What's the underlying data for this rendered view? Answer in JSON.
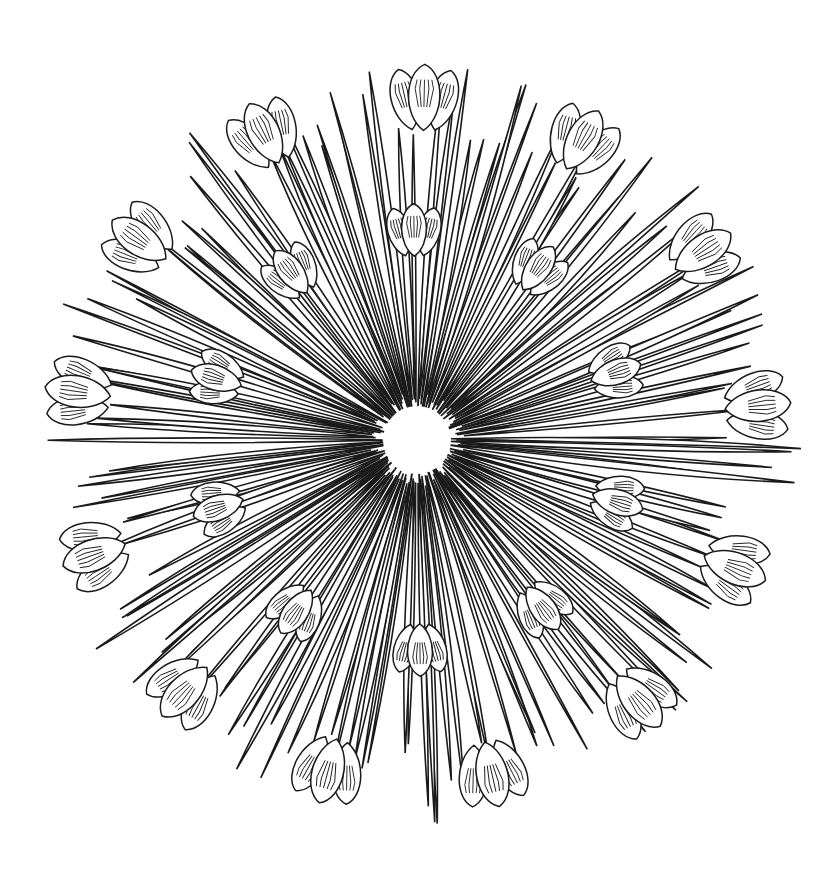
{
  "illustration": {
    "subject": "radial crocus mandala line art",
    "style": "black outline coloring page",
    "center": [
      417,
      440
    ],
    "colors": {
      "background": "#ffffff",
      "line": "#1a1a1a"
    },
    "leaves": {
      "count": 150,
      "inner_radius": 28,
      "outer_radius_min": 300,
      "outer_radius_max": 385
    },
    "outer_flowers": {
      "count": 13,
      "radius": 330,
      "size": 58
    },
    "inner_flowers": {
      "count": 10,
      "radius": 200,
      "size": 46
    }
  }
}
